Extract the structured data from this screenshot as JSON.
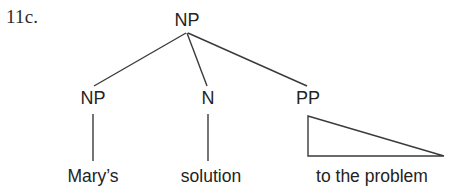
{
  "figure": {
    "example_number": "11c.",
    "caption": "",
    "background_color": "#ffffff",
    "line_color": "#3a3a3a",
    "text_color": "#232323"
  },
  "tree": {
    "root": {
      "label": "NP",
      "x": 187,
      "y": 20
    },
    "nodes": [
      {
        "id": "np-left",
        "label": "NP",
        "x": 93,
        "y": 98
      },
      {
        "id": "n-mid",
        "label": "N",
        "x": 208,
        "y": 98
      },
      {
        "id": "pp-right",
        "label": "PP",
        "x": 308,
        "y": 98
      }
    ],
    "leaves": [
      {
        "id": "leaf-marys",
        "label": "Mary’s",
        "parent": "np-left",
        "x": 93,
        "y": 177
      },
      {
        "id": "leaf-solution",
        "label": "solution",
        "parent": "n-mid",
        "x": 211,
        "y": 177
      },
      {
        "id": "leaf-to-the-problem",
        "label": "to the problem",
        "parent": "pp-right",
        "x": 372,
        "y": 177
      }
    ],
    "branches": [
      {
        "from": "root",
        "to": "np-left"
      },
      {
        "from": "root",
        "to": "n-mid"
      },
      {
        "from": "root",
        "to": "pp-right"
      }
    ],
    "triangle": {
      "for": "pp-right",
      "apex_x": 308,
      "apex_y": 116,
      "base_left_x": 308,
      "base_right_x": 444,
      "base_y": 156
    }
  }
}
